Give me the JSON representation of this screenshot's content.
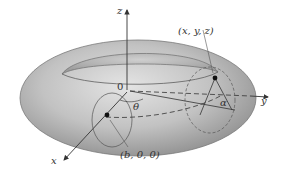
{
  "figure": {
    "axes": {
      "x_label": "x",
      "y_label": "y",
      "z_label": "z",
      "origin_label": "0"
    },
    "angles": {
      "theta_label": "θ",
      "alpha_label": "α"
    },
    "points": {
      "surface_point_label": "(x, y, z)",
      "center_point_label": "(b, 0, 0)"
    },
    "colors": {
      "torus_light": "#d9d9d9",
      "torus_mid": "#b8b8b8",
      "torus_dark": "#8c8c8c",
      "line": "#444444",
      "background": "#ffffff"
    }
  }
}
